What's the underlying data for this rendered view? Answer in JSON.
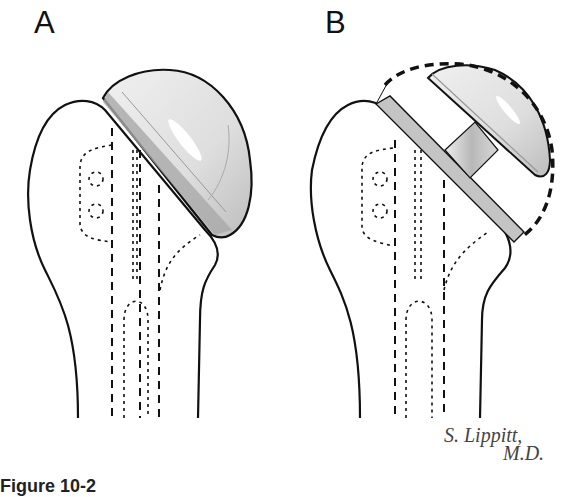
{
  "figure": {
    "panels": [
      {
        "id": "A",
        "label": "A",
        "description": "Humeral head prosthesis seated directly on humeral osteotomy"
      },
      {
        "id": "B",
        "label": "B",
        "description": "Humeral head prosthesis with neck/collar offset; dashed outline indicates original head contour"
      }
    ],
    "signature": {
      "line1": "S. Lippitt,",
      "line2": "M.D."
    },
    "caption": "Figure 10-2"
  },
  "colors": {
    "outline": "#111111",
    "implant_light": "#e4e4e4",
    "implant_mid": "#c8c8c8",
    "implant_dark": "#a8a8a8",
    "background": "#ffffff"
  }
}
